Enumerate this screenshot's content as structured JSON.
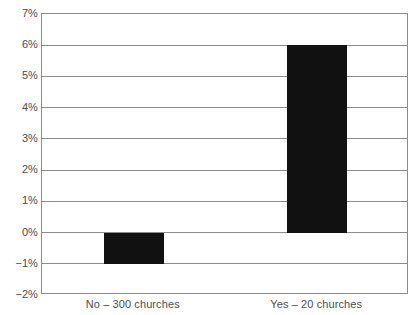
{
  "chart_data": {
    "type": "bar",
    "title": "",
    "subtitle": "",
    "xlabel": "",
    "ylabel": "",
    "categories": [
      "No – 300 churches",
      "Yes – 20 churches"
    ],
    "values": [
      -1,
      6
    ],
    "value_unit": "%",
    "ylim": [
      -2,
      7
    ],
    "ytick_values": [
      7,
      6,
      5,
      4,
      3,
      2,
      1,
      0,
      -1,
      -2
    ],
    "ytick_labels": [
      "7%",
      "6%",
      "5%",
      "4%",
      "3%",
      "2%",
      "1%",
      "0%",
      "−1%",
      "−2%"
    ],
    "grid": true,
    "grid_axis": "y",
    "legend": false,
    "legend_position": "none",
    "series": [
      {
        "name": "",
        "values": [
          -1,
          6
        ]
      }
    ],
    "colors": {
      "bar": "#111111",
      "gridline": "#8c8c8c",
      "axis": "#8c8c8c",
      "text": "#4d4d4d",
      "background": "#ffffff"
    }
  }
}
